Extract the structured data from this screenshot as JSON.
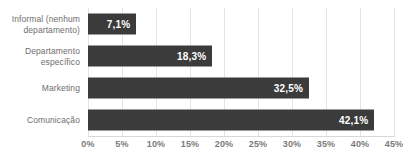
{
  "chart_data": {
    "type": "bar",
    "orientation": "horizontal",
    "title": "",
    "subtitle": "",
    "xlabel": "",
    "ylabel": "",
    "xlim": [
      0,
      45
    ],
    "xtick_step": 5,
    "grid": true,
    "legend": "none",
    "bar_color": "#3b3b3b",
    "label_color": "#6e6e6e",
    "tick_color": "#7b7b7b",
    "grid_color": "#e4e4e4",
    "value_label_color": "#ffffff",
    "categories": [
      "Informal (nenhum\ndepartamento)",
      "Departamento\nespecífico",
      "Marketing",
      "Comunicação"
    ],
    "values": [
      7.1,
      18.3,
      32.5,
      42.1
    ],
    "value_labels": [
      "7,1%",
      "18,3%",
      "32,5%",
      "42,1%"
    ],
    "xticks": [
      "0%",
      "5%",
      "10%",
      "15%",
      "20%",
      "25%",
      "30%",
      "35%",
      "40%",
      "45%"
    ],
    "xtick_values": [
      0,
      5,
      10,
      15,
      20,
      25,
      30,
      35,
      40,
      45
    ]
  }
}
